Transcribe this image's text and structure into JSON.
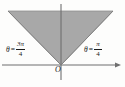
{
  "figure": {
    "kind": "polar-region-diagram",
    "background_color": "#fdfdfc",
    "shading_color": "#a8a8a8",
    "shading_edge_color": "#8d8d8d",
    "axis_color": "#6f6f6f",
    "text_color": "#1a1a1a"
  },
  "labels": {
    "origin": "O",
    "left_angle": {
      "variable": "θ",
      "equals": "=",
      "numerator": "3π",
      "denominator": "4",
      "full": "θ = 3π/4"
    },
    "right_angle": {
      "variable": "θ",
      "equals": "=",
      "numerator": "π",
      "denominator": "4",
      "full": "θ = π/4"
    }
  },
  "geometry": {
    "origin": {
      "x": 61,
      "y": 65
    },
    "wedge_points": "8,11 113,11 61,65",
    "x_axis": {
      "x1": 2,
      "y1": 65,
      "x2": 121,
      "y2": 65,
      "arrow_right": true
    },
    "y_axis": {
      "x1": 61,
      "y1": 4,
      "x2": 61,
      "y2": 80,
      "arrow": false
    },
    "boundary_left": {
      "x1": 61,
      "y1": 65,
      "x2": 8,
      "y2": 11
    },
    "boundary_right": {
      "x1": 61,
      "y1": 65,
      "x2": 113,
      "y2": 11
    }
  }
}
